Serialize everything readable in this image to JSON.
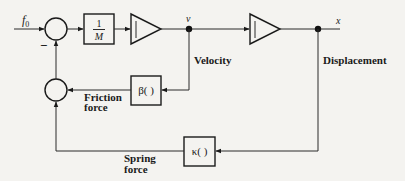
{
  "diagram": {
    "type": "block-diagram",
    "input": {
      "label": "f",
      "subscript": "0"
    },
    "blocks": [
      {
        "id": "gain",
        "kind": "box",
        "numerator": "1",
        "denominator": "M"
      },
      {
        "id": "integrator1",
        "kind": "integrator",
        "symbol": "∫"
      },
      {
        "id": "integrator2",
        "kind": "integrator",
        "symbol": "∫"
      },
      {
        "id": "friction",
        "kind": "box",
        "text": "β( )"
      },
      {
        "id": "spring",
        "kind": "box",
        "text": "κ( )"
      }
    ],
    "summing_junctions": [
      {
        "id": "sum1",
        "sign_bottom": "−"
      },
      {
        "id": "sum2"
      }
    ],
    "signals": {
      "velocity_symbol": "v",
      "velocity_label": "Velocity",
      "displacement_symbol": "x",
      "displacement_label": "Displacement",
      "friction_label_1": "Friction",
      "friction_label_2": "force",
      "spring_label_1": "Spring",
      "spring_label_2": "force"
    },
    "connections": [
      [
        "input",
        "sum1"
      ],
      [
        "sum1",
        "gain"
      ],
      [
        "gain",
        "integrator1"
      ],
      [
        "integrator1",
        "node_v"
      ],
      [
        "node_v",
        "integrator2"
      ],
      [
        "integrator2",
        "node_x"
      ],
      [
        "node_v",
        "friction"
      ],
      [
        "friction",
        "sum2"
      ],
      [
        "node_x",
        "spring"
      ],
      [
        "spring",
        "sum2"
      ],
      [
        "sum2",
        "sum1"
      ]
    ]
  }
}
